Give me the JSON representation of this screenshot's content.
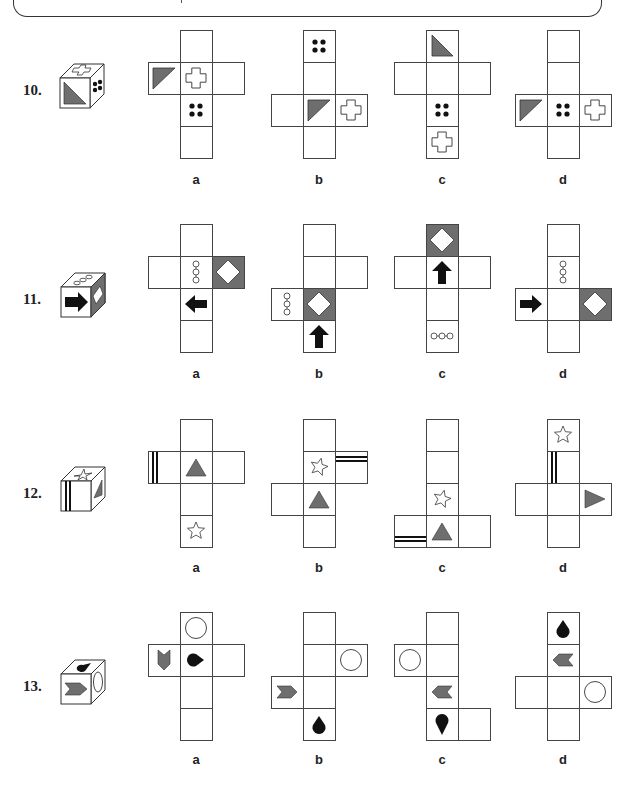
{
  "page": {
    "colors": {
      "gray": "#6e6e6e",
      "black": "#111111",
      "line": "#444444"
    }
  },
  "cell_size": 32,
  "questions": [
    {
      "number": "10.",
      "top": 30,
      "label_y": 172,
      "cube": {
        "x": 60,
        "y": 78,
        "front": "triangle-bl",
        "top": "cross",
        "side": "dots4"
      },
      "options": [
        {
          "label": "a",
          "x0": 148,
          "cells": [
            {
              "c": 1,
              "r": 0,
              "sym": ""
            },
            {
              "c": 0,
              "r": 1,
              "sym": "triangle-tl"
            },
            {
              "c": 1,
              "r": 1,
              "sym": "cross"
            },
            {
              "c": 2,
              "r": 1,
              "sym": ""
            },
            {
              "c": 1,
              "r": 2,
              "sym": "dots4"
            },
            {
              "c": 1,
              "r": 3,
              "sym": ""
            }
          ]
        },
        {
          "label": "b",
          "x0": 271,
          "cells": [
            {
              "c": 1,
              "r": 0,
              "sym": "dots4"
            },
            {
              "c": 1,
              "r": 1,
              "sym": ""
            },
            {
              "c": 0,
              "r": 2,
              "sym": ""
            },
            {
              "c": 1,
              "r": 2,
              "sym": "triangle-tl"
            },
            {
              "c": 2,
              "r": 2,
              "sym": "cross"
            },
            {
              "c": 1,
              "r": 3,
              "sym": ""
            }
          ]
        },
        {
          "label": "c",
          "x0": 394,
          "cells": [
            {
              "c": 1,
              "r": 0,
              "sym": "triangle-tr-down"
            },
            {
              "c": 0,
              "r": 1,
              "sym": ""
            },
            {
              "c": 1,
              "r": 1,
              "sym": ""
            },
            {
              "c": 2,
              "r": 1,
              "sym": ""
            },
            {
              "c": 1,
              "r": 2,
              "sym": "dots4"
            },
            {
              "c": 1,
              "r": 3,
              "sym": "cross"
            }
          ]
        },
        {
          "label": "d",
          "x0": 515,
          "cells": [
            {
              "c": 1,
              "r": 0,
              "sym": ""
            },
            {
              "c": 1,
              "r": 1,
              "sym": ""
            },
            {
              "c": 0,
              "r": 2,
              "sym": "triangle-tl"
            },
            {
              "c": 1,
              "r": 2,
              "sym": "dots4"
            },
            {
              "c": 2,
              "r": 2,
              "sym": "cross"
            },
            {
              "c": 1,
              "r": 3,
              "sym": ""
            }
          ]
        }
      ]
    },
    {
      "number": "11.",
      "top": 224,
      "label_y": 366,
      "cube": {
        "x": 61,
        "y": 287,
        "front": "arrow-right",
        "top": "chain3-diag",
        "side": "diamond-gray"
      },
      "options": [
        {
          "label": "a",
          "x0": 148,
          "cells": [
            {
              "c": 1,
              "r": 0,
              "sym": ""
            },
            {
              "c": 0,
              "r": 1,
              "sym": ""
            },
            {
              "c": 1,
              "r": 1,
              "sym": "chain3-v"
            },
            {
              "c": 2,
              "r": 1,
              "sym": "diamond-gray"
            },
            {
              "c": 1,
              "r": 2,
              "sym": "arrow-left"
            },
            {
              "c": 1,
              "r": 3,
              "sym": ""
            }
          ]
        },
        {
          "label": "b",
          "x0": 271,
          "cells": [
            {
              "c": 1,
              "r": 0,
              "sym": ""
            },
            {
              "c": 1,
              "r": 1,
              "sym": ""
            },
            {
              "c": 2,
              "r": 1,
              "sym": ""
            },
            {
              "c": 0,
              "r": 2,
              "sym": "chain3-v"
            },
            {
              "c": 1,
              "r": 2,
              "sym": "diamond-gray"
            },
            {
              "c": 1,
              "r": 3,
              "sym": "arrow-up"
            }
          ]
        },
        {
          "label": "c",
          "x0": 394,
          "cells": [
            {
              "c": 1,
              "r": 0,
              "sym": "diamond-gray"
            },
            {
              "c": 0,
              "r": 1,
              "sym": ""
            },
            {
              "c": 1,
              "r": 1,
              "sym": "arrow-up"
            },
            {
              "c": 2,
              "r": 1,
              "sym": ""
            },
            {
              "c": 1,
              "r": 2,
              "sym": ""
            },
            {
              "c": 1,
              "r": 3,
              "sym": "chain3-h"
            }
          ]
        },
        {
          "label": "d",
          "x0": 515,
          "cells": [
            {
              "c": 1,
              "r": 0,
              "sym": ""
            },
            {
              "c": 1,
              "r": 1,
              "sym": "chain3-v"
            },
            {
              "c": 0,
              "r": 2,
              "sym": "arrow-right"
            },
            {
              "c": 1,
              "r": 2,
              "sym": ""
            },
            {
              "c": 2,
              "r": 2,
              "sym": "diamond-gray"
            },
            {
              "c": 1,
              "r": 3,
              "sym": ""
            }
          ]
        }
      ]
    },
    {
      "number": "12.",
      "top": 419,
      "label_y": 560,
      "cube": {
        "x": 61,
        "y": 481,
        "front": "bars-v-left",
        "top": "star",
        "side": "triangle-side"
      },
      "options": [
        {
          "label": "a",
          "x0": 148,
          "cells": [
            {
              "c": 1,
              "r": 0,
              "sym": ""
            },
            {
              "c": 0,
              "r": 1,
              "sym": "bars-v-left"
            },
            {
              "c": 1,
              "r": 1,
              "sym": "triangle-up"
            },
            {
              "c": 2,
              "r": 1,
              "sym": ""
            },
            {
              "c": 1,
              "r": 2,
              "sym": ""
            },
            {
              "c": 1,
              "r": 3,
              "sym": "star"
            }
          ]
        },
        {
          "label": "b",
          "x0": 271,
          "cells": [
            {
              "c": 1,
              "r": 0,
              "sym": ""
            },
            {
              "c": 1,
              "r": 1,
              "sym": "star-tilt"
            },
            {
              "c": 2,
              "r": 1,
              "sym": "bars-h-top"
            },
            {
              "c": 0,
              "r": 2,
              "sym": ""
            },
            {
              "c": 1,
              "r": 2,
              "sym": "triangle-up"
            },
            {
              "c": 1,
              "r": 3,
              "sym": ""
            }
          ]
        },
        {
          "label": "c",
          "x0": 394,
          "cells": [
            {
              "c": 1,
              "r": 0,
              "sym": ""
            },
            {
              "c": 1,
              "r": 1,
              "sym": ""
            },
            {
              "c": 1,
              "r": 2,
              "sym": "star-tilt"
            },
            {
              "c": 0,
              "r": 3,
              "sym": "bars-h-bottom"
            },
            {
              "c": 1,
              "r": 3,
              "sym": "triangle-up"
            },
            {
              "c": 2,
              "r": 3,
              "sym": ""
            }
          ]
        },
        {
          "label": "d",
          "x0": 515,
          "cells": [
            {
              "c": 1,
              "r": 0,
              "sym": "star"
            },
            {
              "c": 1,
              "r": 1,
              "sym": "bars-v-left"
            },
            {
              "c": 0,
              "r": 2,
              "sym": ""
            },
            {
              "c": 1,
              "r": 2,
              "sym": ""
            },
            {
              "c": 2,
              "r": 2,
              "sym": "triangle-right"
            },
            {
              "c": 1,
              "r": 3,
              "sym": ""
            }
          ]
        }
      ]
    },
    {
      "number": "13.",
      "top": 612,
      "label_y": 752,
      "cube": {
        "x": 61,
        "y": 674,
        "front": "chevron-right",
        "top": "drop-side",
        "side": "circle-side"
      },
      "options": [
        {
          "label": "a",
          "x0": 148,
          "cells": [
            {
              "c": 1,
              "r": 0,
              "sym": "circle"
            },
            {
              "c": 0,
              "r": 1,
              "sym": "chevron-down"
            },
            {
              "c": 1,
              "r": 1,
              "sym": "drop-right"
            },
            {
              "c": 2,
              "r": 1,
              "sym": ""
            },
            {
              "c": 1,
              "r": 2,
              "sym": ""
            },
            {
              "c": 1,
              "r": 3,
              "sym": ""
            }
          ]
        },
        {
          "label": "b",
          "x0": 271,
          "cells": [
            {
              "c": 1,
              "r": 0,
              "sym": ""
            },
            {
              "c": 1,
              "r": 1,
              "sym": ""
            },
            {
              "c": 2,
              "r": 1,
              "sym": "circle"
            },
            {
              "c": 0,
              "r": 2,
              "sym": "chevron-right"
            },
            {
              "c": 1,
              "r": 2,
              "sym": ""
            },
            {
              "c": 1,
              "r": 3,
              "sym": "drop-up"
            }
          ]
        },
        {
          "label": "c",
          "x0": 394,
          "cells": [
            {
              "c": 1,
              "r": 0,
              "sym": ""
            },
            {
              "c": 0,
              "r": 1,
              "sym": "circle"
            },
            {
              "c": 1,
              "r": 1,
              "sym": ""
            },
            {
              "c": 1,
              "r": 2,
              "sym": "chevron-left"
            },
            {
              "c": 1,
              "r": 3,
              "sym": "drop-down"
            },
            {
              "c": 2,
              "r": 3,
              "sym": ""
            }
          ]
        },
        {
          "label": "d",
          "x0": 515,
          "cells": [
            {
              "c": 1,
              "r": 0,
              "sym": "drop-up"
            },
            {
              "c": 1,
              "r": 1,
              "sym": "chevron-left"
            },
            {
              "c": 0,
              "r": 2,
              "sym": ""
            },
            {
              "c": 1,
              "r": 2,
              "sym": ""
            },
            {
              "c": 2,
              "r": 2,
              "sym": "circle"
            },
            {
              "c": 1,
              "r": 3,
              "sym": ""
            }
          ]
        }
      ]
    }
  ]
}
